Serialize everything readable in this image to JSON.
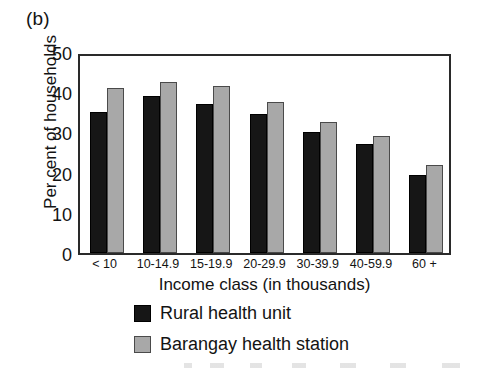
{
  "panel": {
    "label": "(b)"
  },
  "chart_data": {
    "type": "bar",
    "title": "",
    "panel_label": "(b)",
    "xlabel": "Income class (in thousands)",
    "ylabel": "Per cent of households",
    "categories": [
      "< 10",
      "10-14.9",
      "15-19.9",
      "20-29.9",
      "30-39.9",
      "40-59.9",
      "60 +"
    ],
    "series": [
      {
        "name": "Rural health unit",
        "color": "#161616",
        "values": [
          35,
          39,
          37,
          34.5,
          30,
          27,
          19.5
        ]
      },
      {
        "name": "Barangay health station",
        "color": "#a8a8a8",
        "values": [
          41,
          42.5,
          41.5,
          37.5,
          32.5,
          29,
          22
        ]
      }
    ],
    "ylim": [
      0,
      50
    ],
    "yticks": [
      50,
      40,
      30,
      20,
      10,
      0
    ],
    "ytick_labels": [
      "50",
      "40",
      "30",
      "20",
      "10",
      "0"
    ],
    "grid": false,
    "legend_position": "below-axis",
    "frame": true
  },
  "legend": {
    "items": [
      {
        "label": "Rural health unit",
        "swatch": "dark-swatch"
      },
      {
        "label": "Barangay health station",
        "swatch": "gray-swatch"
      }
    ]
  }
}
